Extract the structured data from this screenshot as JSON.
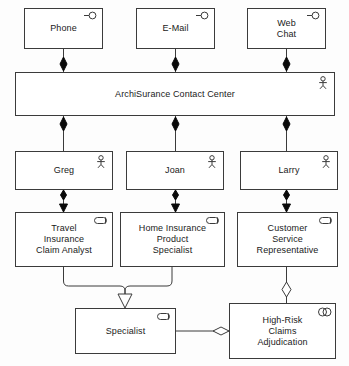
{
  "diagram": {
    "notation": "ArchiMate",
    "background_color": "#ffffff",
    "line_color": "#3b3b3b",
    "text_color": "#1a1a1a"
  },
  "nodes": [
    {
      "id": "phone",
      "label": "Phone",
      "icon": "business-interface-icon",
      "type": "business-interface",
      "x": 24,
      "y": 8,
      "w": 79,
      "h": 41
    },
    {
      "id": "email",
      "label": "E-Mail",
      "icon": "business-interface-icon",
      "type": "business-interface",
      "x": 136,
      "y": 8,
      "w": 79,
      "h": 41
    },
    {
      "id": "web-chat",
      "label": "Web\nChat",
      "icon": "business-interface-icon",
      "type": "business-interface",
      "x": 247,
      "y": 8,
      "w": 79,
      "h": 41
    },
    {
      "id": "archisurance-contact-center",
      "label": "ArchiSurance Contact Center",
      "icon": "business-actor-icon",
      "type": "business-actor",
      "x": 15,
      "y": 72,
      "w": 320,
      "h": 44
    },
    {
      "id": "greg",
      "label": "Greg",
      "icon": "business-actor-icon",
      "type": "business-actor",
      "x": 15,
      "y": 151,
      "w": 98,
      "h": 39
    },
    {
      "id": "joan",
      "label": "Joan",
      "icon": "business-actor-icon",
      "type": "business-actor",
      "x": 126,
      "y": 151,
      "w": 98,
      "h": 39
    },
    {
      "id": "larry",
      "label": "Larry",
      "icon": "business-actor-icon",
      "type": "business-actor",
      "x": 240,
      "y": 151,
      "w": 98,
      "h": 39
    },
    {
      "id": "travel-insurance-claim-analyst",
      "label": "Travel\nInsurance\nClaim Analyst",
      "icon": "business-role-icon",
      "type": "business-role",
      "x": 15,
      "y": 212,
      "w": 98,
      "h": 55
    },
    {
      "id": "home-insurance-product-specialist",
      "label": "Home Insurance\nProduct\nSpecialist",
      "icon": "business-role-icon",
      "type": "business-role",
      "x": 120,
      "y": 212,
      "w": 105,
      "h": 55
    },
    {
      "id": "customer-service-representative",
      "label": "Customer\nService\nRepresentative",
      "icon": "business-role-icon",
      "type": "business-role",
      "x": 237,
      "y": 212,
      "w": 101,
      "h": 55
    },
    {
      "id": "specialist",
      "label": "Specialist",
      "icon": "business-role-icon",
      "type": "business-role",
      "x": 75,
      "y": 308,
      "w": 101,
      "h": 46
    },
    {
      "id": "high-risk-claims-adjudication",
      "label": "High-Risk\nClaims\nAdjudication",
      "icon": "business-collaboration-icon",
      "type": "business-collaboration",
      "x": 229,
      "y": 303,
      "w": 107,
      "h": 56
    }
  ],
  "edges": [
    {
      "id": "phone-to-center",
      "from": "phone",
      "to": "archisurance-contact-center",
      "type": "composition"
    },
    {
      "id": "email-to-center",
      "from": "email",
      "to": "archisurance-contact-center",
      "type": "composition"
    },
    {
      "id": "webchat-to-center",
      "from": "web-chat",
      "to": "archisurance-contact-center",
      "type": "composition"
    },
    {
      "id": "center-to-greg",
      "from": "archisurance-contact-center",
      "to": "greg",
      "type": "composition"
    },
    {
      "id": "center-to-joan",
      "from": "archisurance-contact-center",
      "to": "joan",
      "type": "composition"
    },
    {
      "id": "center-to-larry",
      "from": "archisurance-contact-center",
      "to": "larry",
      "type": "composition"
    },
    {
      "id": "greg-to-travel-analyst",
      "from": "greg",
      "to": "travel-insurance-claim-analyst",
      "type": "assignment"
    },
    {
      "id": "joan-to-home-specialist",
      "from": "joan",
      "to": "home-insurance-product-specialist",
      "type": "assignment"
    },
    {
      "id": "larry-to-csr",
      "from": "larry",
      "to": "customer-service-representative",
      "type": "assignment"
    },
    {
      "id": "travel-analyst-to-specialist",
      "from": "travel-insurance-claim-analyst",
      "to": "specialist",
      "type": "specialization"
    },
    {
      "id": "home-specialist-to-specialist",
      "from": "home-insurance-product-specialist",
      "to": "specialist",
      "type": "specialization"
    },
    {
      "id": "csr-to-high-risk",
      "from": "customer-service-representative",
      "to": "high-risk-claims-adjudication",
      "type": "aggregation"
    },
    {
      "id": "specialist-to-high-risk",
      "from": "specialist",
      "to": "high-risk-claims-adjudication",
      "type": "aggregation"
    }
  ]
}
